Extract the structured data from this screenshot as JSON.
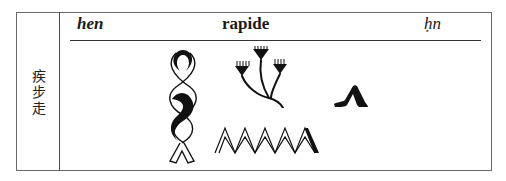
{
  "entry": {
    "chinese_label": [
      "疾",
      "步",
      "走"
    ],
    "header": {
      "transliteration_left": "hen",
      "french_meaning": "rapide",
      "transliteration_right": "ḥn"
    },
    "hieroglyphs": [
      {
        "name": "twisted-flax-wick-hieroglyph",
        "sign": "V28"
      },
      {
        "name": "papyrus-plant-hieroglyph",
        "sign": "M2"
      },
      {
        "name": "water-ripple-hieroglyph",
        "sign": "N35"
      },
      {
        "name": "walking-legs-hieroglyph",
        "sign": "D54"
      }
    ]
  }
}
